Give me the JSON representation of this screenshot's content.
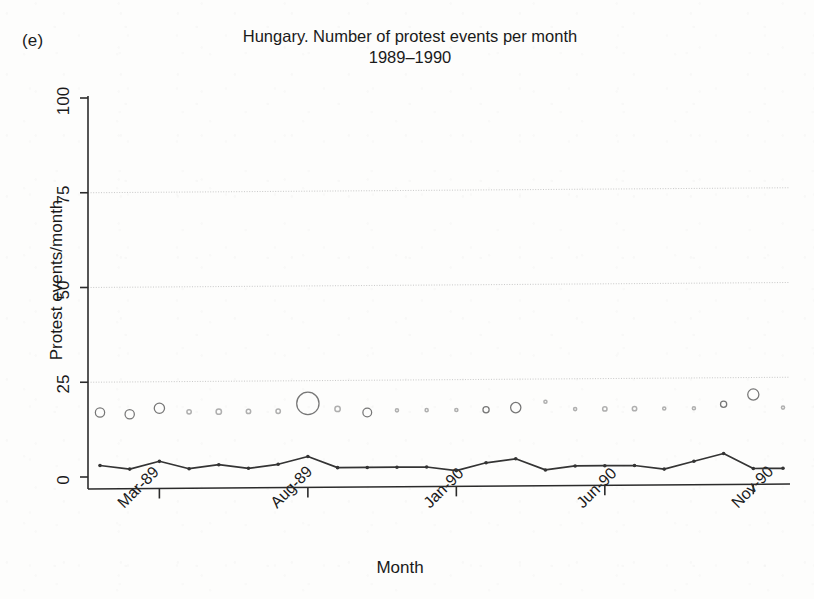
{
  "panel": {
    "label": "(e)"
  },
  "title": {
    "line1": "Hungary. Number of protest events per month",
    "line2": "1989–1990"
  },
  "axes": {
    "ylabel": "Protest events/month",
    "xlabel": "Month",
    "y_ticks": [
      "0",
      "25",
      "50",
      "75",
      "100"
    ],
    "x_ticks": [
      "Mar-89",
      "Aug-89",
      "Jan-90",
      "Jun-90",
      "Nov-90"
    ]
  },
  "style": {
    "ink": "#2b2b2b",
    "grid": "#b9b9b9",
    "bubble_stroke": "#6f6f6f",
    "line_color": "#343434",
    "paper": "#fdfdfc"
  },
  "chart_data": {
    "type": "scatter",
    "title": "Hungary. Number of protest events per month 1989–1990",
    "xlabel": "Month",
    "ylabel": "Protest events/month",
    "ylim": [
      0,
      100
    ],
    "grid": true,
    "legend": "none",
    "xlim_labels": [
      "Jan-89",
      "Dec-90"
    ],
    "x": [
      "Jan-89",
      "Feb-89",
      "Mar-89",
      "Apr-89",
      "May-89",
      "Jun-89",
      "Jul-89",
      "Aug-89",
      "Sep-89",
      "Oct-89",
      "Nov-89",
      "Dec-89",
      "Jan-90",
      "Feb-90",
      "Mar-90",
      "Apr-90",
      "May-90",
      "Jun-90",
      "Jul-90",
      "Aug-90",
      "Sep-90",
      "Oct-90",
      "Nov-90",
      "Dec-90"
    ],
    "series": [
      {
        "name": "Mean protest size (bubble marker)",
        "type": "bubble",
        "note": "open circles plotted near y≈17–19; marker area encodes magnitude",
        "y": [
          17,
          16.5,
          18,
          17,
          17,
          17,
          17,
          19,
          17.5,
          16.5,
          17,
          17,
          17,
          17,
          17.5,
          19,
          17,
          17,
          17,
          17,
          17,
          18,
          20.5,
          17
        ],
        "size": [
          9,
          9,
          11,
          2,
          3,
          2,
          2,
          52,
          3,
          8,
          1,
          1,
          1,
          4,
          11,
          1,
          1,
          2,
          2,
          1,
          1,
          4,
          13,
          1
        ]
      },
      {
        "name": "Protest events/month",
        "type": "line",
        "values": [
          3,
          2,
          4,
          2,
          3,
          2,
          3,
          5,
          2,
          2,
          2,
          2,
          1,
          3,
          4,
          1,
          2,
          2,
          2,
          1,
          3,
          5,
          1,
          1
        ]
      }
    ]
  }
}
